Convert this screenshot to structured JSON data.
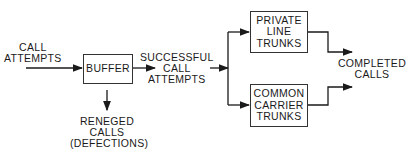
{
  "diagram": {
    "inputs": {
      "call_attempts": [
        "CALL",
        "ATTEMPTS"
      ]
    },
    "nodes": {
      "buffer": [
        "BUFFER"
      ],
      "private_line_trunks": [
        "PRIVATE",
        "LINE",
        "TRUNKS"
      ],
      "common_carrier_trunks": [
        "COMMON",
        "CARRIER",
        "TRUNKS"
      ]
    },
    "edges_labels": {
      "successful_call_attempts": [
        "SUCCESSFUL",
        "CALL",
        "ATTEMPTS"
      ],
      "reneged_calls": [
        "RENEGED",
        "CALLS",
        "(DEFECTIONS)"
      ],
      "completed_calls": [
        "COMPLETED",
        "CALLS"
      ]
    },
    "colors": {
      "line": "#1a1a1a",
      "background": "#ffffff"
    }
  }
}
